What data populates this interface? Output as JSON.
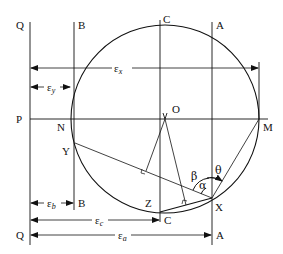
{
  "diagram": {
    "colors": {
      "line": "#111111",
      "background": "#ffffff"
    },
    "circle": {
      "cx": 165,
      "cy": 119,
      "r": 94
    },
    "points": {
      "O": "O",
      "M": "M",
      "N": "N",
      "P": "P",
      "Y": "Y",
      "Z": "Z",
      "X": "X",
      "Q_top": "Q",
      "Q_bottom": "Q",
      "B_top": "B",
      "B_bottom": "B",
      "C_top": "C",
      "C_bottom": "C",
      "A_top": "A",
      "A_bottom": "A"
    },
    "dimensions": {
      "eps_x": "ε",
      "eps_x_sub": "x",
      "eps_y": "ε",
      "eps_y_sub": "y",
      "eps_b": "ε",
      "eps_b_sub": "b",
      "eps_c": "ε",
      "eps_c_sub": "c",
      "eps_a": "ε",
      "eps_a_sub": "a"
    },
    "angles": {
      "alpha": "α",
      "beta": "β",
      "theta": "θ"
    }
  }
}
